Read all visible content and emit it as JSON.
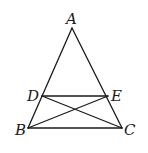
{
  "diagram": {
    "type": "geometry-triangle",
    "points": {
      "A": {
        "label": "A",
        "x": 72,
        "y": 28
      },
      "B": {
        "label": "B",
        "x": 28,
        "y": 128
      },
      "C": {
        "label": "C",
        "x": 122,
        "y": 128
      },
      "D": {
        "label": "D",
        "x": 42,
        "y": 96
      },
      "E": {
        "label": "E",
        "x": 108,
        "y": 96
      }
    },
    "segments": [
      "AB",
      "AC",
      "BC",
      "DE",
      "DC",
      "EB"
    ],
    "labels": {
      "A": "A",
      "B": "B",
      "C": "C",
      "D": "D",
      "E": "E"
    }
  }
}
